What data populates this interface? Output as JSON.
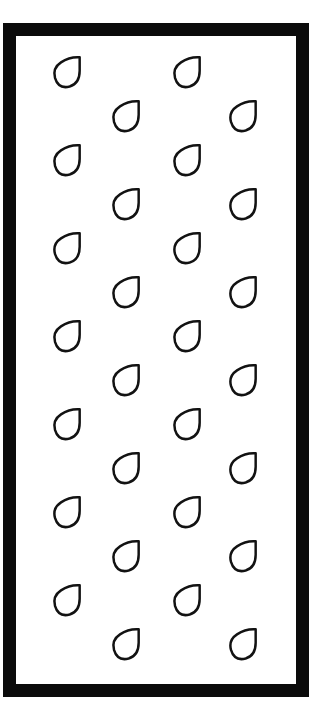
{
  "card": {
    "title": "Raindrop Pattern Card",
    "background_color": "#ffffff",
    "frame_color": "#0b0b0b",
    "frame_border_width_px": 13,
    "paper_color": "#ffffff"
  },
  "motif": {
    "name": "raindrop",
    "icon_name": "raindrop-icon",
    "style": "hand-drawn outline",
    "outline_color": "#121212",
    "fill_color": "#ffffff",
    "stroke_width_px": 4,
    "width_px": 32,
    "height_px": 37,
    "orientation": "tip-top-right",
    "count_total": 28
  },
  "pattern": {
    "type": "staggered-grid",
    "columns": 4,
    "rows_per_column": 7,
    "column_centers_x": [
      67,
      126,
      187,
      243
    ],
    "column_offsets_y": [
      0,
      44,
      0,
      44
    ],
    "row_pitch_y": 88,
    "first_row_center_y": 73,
    "drops": [
      {
        "col": 1,
        "row": 1,
        "cx": 67,
        "cy": 73
      },
      {
        "col": 1,
        "row": 2,
        "cx": 67,
        "cy": 161
      },
      {
        "col": 1,
        "row": 3,
        "cx": 67,
        "cy": 249
      },
      {
        "col": 1,
        "row": 4,
        "cx": 67,
        "cy": 337
      },
      {
        "col": 1,
        "row": 5,
        "cx": 67,
        "cy": 425
      },
      {
        "col": 1,
        "row": 6,
        "cx": 67,
        "cy": 513
      },
      {
        "col": 1,
        "row": 7,
        "cx": 67,
        "cy": 601
      },
      {
        "col": 2,
        "row": 1,
        "cx": 126,
        "cy": 117
      },
      {
        "col": 2,
        "row": 2,
        "cx": 126,
        "cy": 205
      },
      {
        "col": 2,
        "row": 3,
        "cx": 126,
        "cy": 293
      },
      {
        "col": 2,
        "row": 4,
        "cx": 126,
        "cy": 381
      },
      {
        "col": 2,
        "row": 5,
        "cx": 126,
        "cy": 469
      },
      {
        "col": 2,
        "row": 6,
        "cx": 126,
        "cy": 557
      },
      {
        "col": 2,
        "row": 7,
        "cx": 126,
        "cy": 645
      },
      {
        "col": 3,
        "row": 1,
        "cx": 187,
        "cy": 73
      },
      {
        "col": 3,
        "row": 2,
        "cx": 187,
        "cy": 161
      },
      {
        "col": 3,
        "row": 3,
        "cx": 187,
        "cy": 249
      },
      {
        "col": 3,
        "row": 4,
        "cx": 187,
        "cy": 337
      },
      {
        "col": 3,
        "row": 5,
        "cx": 187,
        "cy": 425
      },
      {
        "col": 3,
        "row": 6,
        "cx": 187,
        "cy": 513
      },
      {
        "col": 3,
        "row": 7,
        "cx": 187,
        "cy": 601
      },
      {
        "col": 4,
        "row": 1,
        "cx": 243,
        "cy": 117
      },
      {
        "col": 4,
        "row": 2,
        "cx": 243,
        "cy": 205
      },
      {
        "col": 4,
        "row": 3,
        "cx": 243,
        "cy": 293
      },
      {
        "col": 4,
        "row": 4,
        "cx": 243,
        "cy": 381
      },
      {
        "col": 4,
        "row": 5,
        "cx": 243,
        "cy": 469
      },
      {
        "col": 4,
        "row": 6,
        "cx": 243,
        "cy": 557
      },
      {
        "col": 4,
        "row": 7,
        "cx": 243,
        "cy": 645
      }
    ]
  }
}
